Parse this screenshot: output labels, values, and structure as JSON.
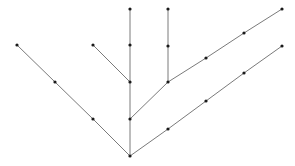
{
  "diagram": {
    "type": "tree",
    "background": "#ffffff",
    "edge_color": "#7a7a7a",
    "node_color": "#1a1a1a",
    "node_radius": 1.6,
    "nodes": [
      {
        "id": "root",
        "x": 130,
        "y": 156
      },
      {
        "id": "l1",
        "x": 93,
        "y": 119
      },
      {
        "id": "l2",
        "x": 55,
        "y": 82
      },
      {
        "id": "l3",
        "x": 17,
        "y": 45
      },
      {
        "id": "m1",
        "x": 130,
        "y": 119
      },
      {
        "id": "m2",
        "x": 130,
        "y": 82
      },
      {
        "id": "m3",
        "x": 130,
        "y": 45
      },
      {
        "id": "m4",
        "x": 130,
        "y": 9
      },
      {
        "id": "ml1",
        "x": 93,
        "y": 45
      },
      {
        "id": "v1",
        "x": 168,
        "y": 82
      },
      {
        "id": "v2",
        "x": 168,
        "y": 46
      },
      {
        "id": "v3",
        "x": 168,
        "y": 9
      },
      {
        "id": "u1",
        "x": 206,
        "y": 58
      },
      {
        "id": "u2",
        "x": 244,
        "y": 33
      },
      {
        "id": "u3",
        "x": 282,
        "y": 9
      },
      {
        "id": "d1",
        "x": 168,
        "y": 129
      },
      {
        "id": "d2",
        "x": 206,
        "y": 101
      },
      {
        "id": "d3",
        "x": 244,
        "y": 73
      },
      {
        "id": "d4",
        "x": 282,
        "y": 46
      }
    ],
    "edges": [
      [
        "root",
        "l1"
      ],
      [
        "l1",
        "l2"
      ],
      [
        "l2",
        "l3"
      ],
      [
        "root",
        "m1"
      ],
      [
        "m1",
        "m2"
      ],
      [
        "m2",
        "m3"
      ],
      [
        "m3",
        "m4"
      ],
      [
        "m2",
        "ml1"
      ],
      [
        "m1",
        "v1"
      ],
      [
        "v1",
        "v2"
      ],
      [
        "v2",
        "v3"
      ],
      [
        "v1",
        "u1"
      ],
      [
        "u1",
        "u2"
      ],
      [
        "u2",
        "u3"
      ],
      [
        "root",
        "d1"
      ],
      [
        "d1",
        "d2"
      ],
      [
        "d2",
        "d3"
      ],
      [
        "d3",
        "d4"
      ]
    ]
  }
}
